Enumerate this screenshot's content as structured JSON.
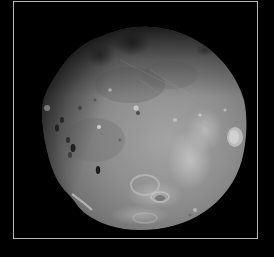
{
  "image": {
    "subject": "Phobos (moon of Mars)",
    "alt_text": "Grayscale photograph of Phobos, a cratered, irregularly shaped moon, on a black background inside a thin gray frame"
  },
  "frame": {
    "border_color": "#b8b8b8",
    "background_color": "#000000"
  },
  "moon": {
    "surface_color": "#8a8a8a",
    "highlight_color": "#c8c8c8",
    "shadow_color": "#2a2a2a"
  }
}
